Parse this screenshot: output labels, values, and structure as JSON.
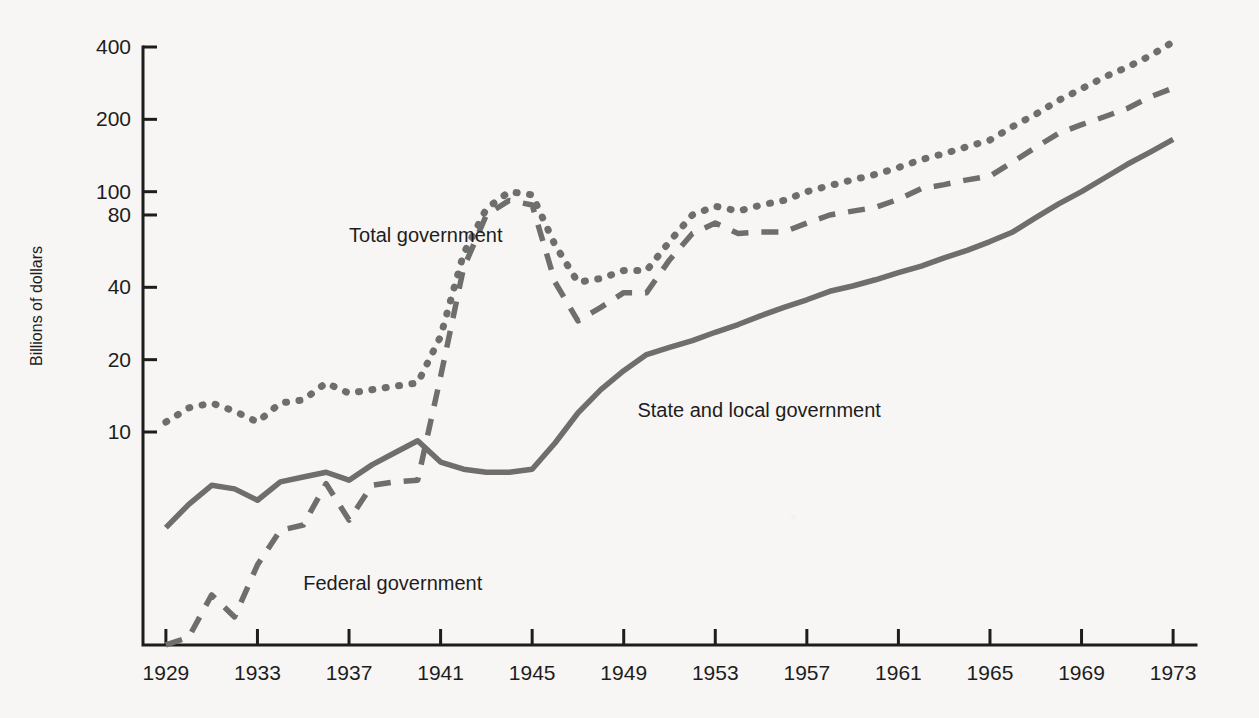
{
  "figure": {
    "background_color": "#f7f6f4",
    "ink_color": "#1d1d1d",
    "series_color": "#6e6e6e"
  },
  "axes": {
    "y_title": "Billions of dollars",
    "y_scale": "log",
    "y_ticks": [
      400,
      200,
      100,
      80,
      40,
      20,
      10
    ],
    "y_tick_labels": [
      "400",
      "200",
      "100",
      "80",
      "40",
      "20",
      "10"
    ],
    "x_tick_labels": [
      "1929",
      "1933",
      "1937",
      "1941",
      "1945",
      "1949",
      "1953",
      "1957",
      "1961",
      "1965",
      "1969",
      "1973"
    ],
    "x_ticks": [
      1929,
      1933,
      1937,
      1941,
      1945,
      1949,
      1953,
      1957,
      1961,
      1965,
      1969,
      1973
    ]
  },
  "labels": {
    "total": "Total government",
    "state_local": "State and local government",
    "federal": "Federal government"
  },
  "chart_data": {
    "type": "line",
    "title": "",
    "subtitle": "",
    "xlabel": "",
    "ylabel": "Billions of dollars",
    "yscale": "log",
    "ylim": [
      1.0,
      480
    ],
    "xlim": [
      1928,
      1974
    ],
    "grid": false,
    "legend": "inline-annotations",
    "ytick_values": [
      400,
      200,
      100,
      80,
      40,
      20,
      10
    ],
    "xtick_values": [
      1929,
      1933,
      1937,
      1941,
      1945,
      1949,
      1953,
      1957,
      1961,
      1965,
      1969,
      1973
    ],
    "x": [
      1929,
      1930,
      1931,
      1932,
      1933,
      1934,
      1935,
      1936,
      1937,
      1938,
      1939,
      1940,
      1941,
      1942,
      1943,
      1944,
      1945,
      1946,
      1947,
      1948,
      1949,
      1950,
      1951,
      1952,
      1953,
      1954,
      1955,
      1956,
      1957,
      1958,
      1959,
      1960,
      1961,
      1962,
      1963,
      1964,
      1965,
      1966,
      1967,
      1968,
      1969,
      1970,
      1971,
      1972,
      1973
    ],
    "series": [
      {
        "name": "Total government",
        "style": "dotted",
        "values": [
          11.0,
          12.6,
          13.2,
          12.2,
          11.0,
          13.2,
          13.6,
          16.0,
          14.5,
          15.0,
          15.5,
          16.0,
          25.0,
          55.0,
          85.0,
          100.0,
          97.0,
          60.0,
          42.0,
          43.5,
          47.0,
          47.0,
          62.0,
          80.0,
          87.0,
          83.0,
          88.0,
          92.0,
          100.0,
          106.0,
          112.0,
          118.0,
          126.0,
          136.0,
          144.0,
          154.0,
          164.0,
          187.0,
          210.0,
          240.0,
          268.0,
          300.0,
          330.0,
          368.0,
          420.0
        ],
        "label_position": {
          "x": 1937,
          "y": 62
        }
      },
      {
        "name": "Federal government",
        "style": "dashed",
        "values": [
          1.3,
          1.4,
          2.1,
          1.7,
          2.8,
          3.9,
          4.1,
          6.1,
          4.3,
          6.0,
          6.2,
          6.3,
          17.0,
          48.0,
          80.0,
          92.0,
          88.0,
          42.0,
          29.0,
          33.0,
          38.0,
          38.0,
          52.0,
          67.0,
          74.0,
          67.0,
          68.0,
          68.0,
          74.0,
          80.0,
          83.0,
          86.0,
          93.0,
          103.0,
          107.0,
          112.0,
          116.0,
          133.0,
          153.0,
          175.0,
          190.0,
          205.0,
          222.0,
          248.0,
          270.0
        ],
        "label_position": {
          "x": 1935,
          "y": 2.2
        }
      },
      {
        "name": "State and local government",
        "style": "solid",
        "values": [
          4.0,
          5.0,
          6.0,
          5.8,
          5.2,
          6.2,
          6.5,
          6.8,
          6.3,
          7.3,
          8.2,
          9.2,
          7.5,
          7.0,
          6.8,
          6.8,
          7.0,
          9.0,
          12.0,
          15.0,
          18.0,
          21.0,
          22.5,
          24.0,
          26.0,
          28.0,
          30.5,
          33.0,
          35.5,
          38.5,
          40.5,
          43.0,
          46.0,
          49.0,
          53.0,
          57.0,
          62.0,
          68.0,
          78.0,
          89.0,
          100.0,
          114.0,
          130.0,
          146.0,
          165.0
        ],
        "label_position": {
          "x": 1949.6,
          "y": 11.5
        }
      }
    ]
  }
}
